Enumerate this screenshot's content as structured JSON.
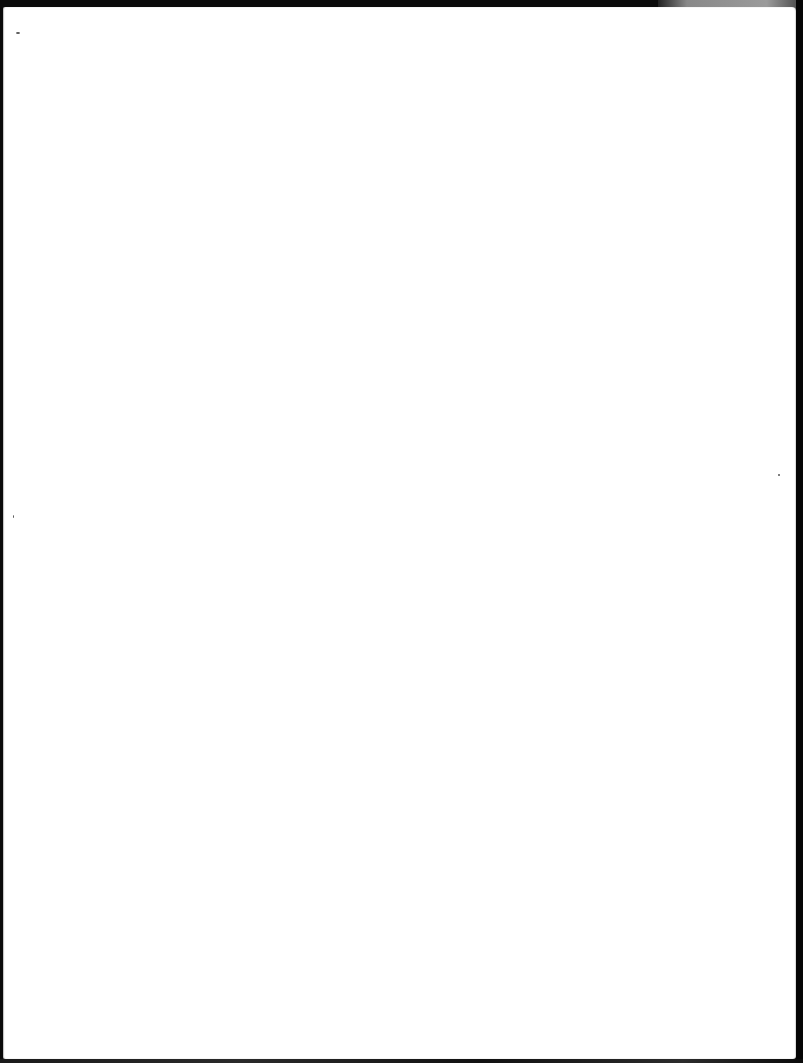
{
  "page": {
    "kind": "blank scanned page",
    "text": "",
    "background_color": "#ffffff",
    "frame_color": "#0a0a0a"
  },
  "marks": [
    {
      "name": "speck-top-left",
      "x": 16,
      "y": 32,
      "w": 4,
      "h": 2
    },
    {
      "name": "speck-right-margin",
      "x": 778,
      "y": 474,
      "w": 2,
      "h": 2
    },
    {
      "name": "speck-left-margin",
      "x": 13,
      "y": 515,
      "w": 1,
      "h": 3
    }
  ]
}
